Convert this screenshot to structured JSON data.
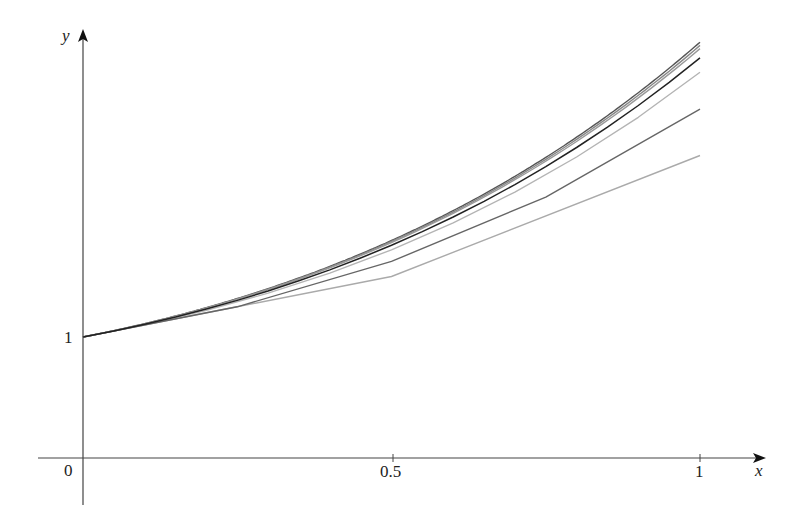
{
  "chart_data": {
    "type": "line",
    "title": "",
    "xlabel": "x",
    "ylabel": "y",
    "xlim": [
      0,
      1
    ],
    "ylim": [
      0,
      3.5
    ],
    "grid": false,
    "legend": null,
    "x_ticks": [
      {
        "value": 0,
        "label": "0"
      },
      {
        "value": 0.5,
        "label": "0.5"
      },
      {
        "value": 1,
        "label": "1"
      }
    ],
    "y_ticks": [
      {
        "value": 1,
        "label": "1"
      }
    ],
    "series": [
      {
        "name": "Euler n=2 (h=0.5)",
        "color": "#aaaaaa",
        "x": [
          0,
          0.5,
          1
        ],
        "y": [
          1,
          1.5,
          2.5
        ]
      },
      {
        "name": "Euler n=4 (h=0.25)",
        "color": "#666666",
        "x": [
          0,
          0.25,
          0.5,
          0.75,
          1
        ],
        "y": [
          1,
          1.25,
          1.625,
          2.1563,
          2.8828
        ]
      },
      {
        "name": "Euler n=10 (h=0.1)",
        "color": "#b4b4b4",
        "x": [
          0,
          0.1,
          0.2,
          0.3,
          0.4,
          0.5,
          0.6,
          0.7,
          0.8,
          0.9,
          1.0
        ],
        "y": [
          1,
          1.1,
          1.22,
          1.362,
          1.5282,
          1.721,
          1.9431,
          2.1974,
          2.4872,
          2.8159,
          3.1875
        ]
      },
      {
        "name": "Euler n=20 (h=0.05)",
        "color": "#222222",
        "h": 0.05
      },
      {
        "name": "Euler n=50 (h=0.02)",
        "color": "#999999",
        "h": 0.02
      },
      {
        "name": "Euler n=100 (h=0.01)",
        "color": "#888888",
        "h": 0.01
      },
      {
        "name": "Exact solution",
        "color": "#555555",
        "formula": "2e^x - x - 1"
      }
    ]
  },
  "axes": {
    "x_label": "x",
    "y_label": "y",
    "origin_label": "0",
    "x_tick_half": "0.5",
    "x_tick_one": "1",
    "y_tick_one": "1"
  }
}
